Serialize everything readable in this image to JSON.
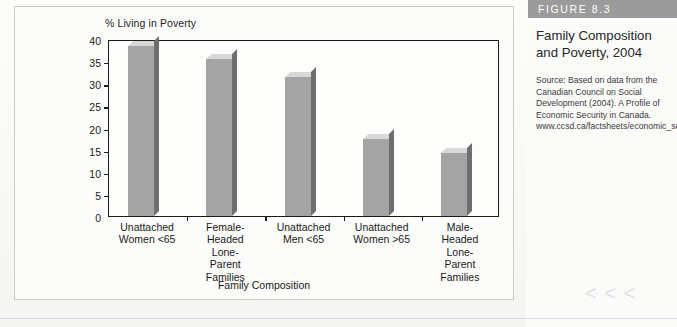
{
  "figure": {
    "band_label": "FIGURE 8.3",
    "title": "Family Composition and Poverty, 2004",
    "source": "Source: Based on data from the Canadian Council on Social Development (2004). A Profile of Economic Security in Canada. www.ccsd.ca/factsheets/economic_security/poverty/index.htm."
  },
  "decor": {
    "chevrons": "< < <"
  },
  "chart_data": {
    "type": "bar",
    "title": "",
    "xlabel": "Family Composition",
    "ylabel": "% Living in Poverty",
    "ylim": [
      0,
      40
    ],
    "yticks": [
      0,
      5,
      10,
      15,
      20,
      25,
      30,
      35,
      40
    ],
    "ytick_labels": [
      "0",
      "5",
      "10",
      "15",
      "20",
      "25",
      "30",
      "35",
      "40"
    ],
    "grid": false,
    "legend": "none",
    "categories": [
      "Unattached\nWomen <65",
      "Female-\nHeaded\nLone-\nParent\nFamilies",
      "Unattached\nMen <65",
      "Unattached\nWomen >65",
      "Male-\nHeaded\nLone-\nParent\nFamilies"
    ],
    "values": [
      38.5,
      35.5,
      31.5,
      17.3,
      14.3
    ],
    "bar_color": "#a4a4a4",
    "bar_top_color": "#d8d8d8",
    "bar_side_color": "#6e6e6e"
  }
}
